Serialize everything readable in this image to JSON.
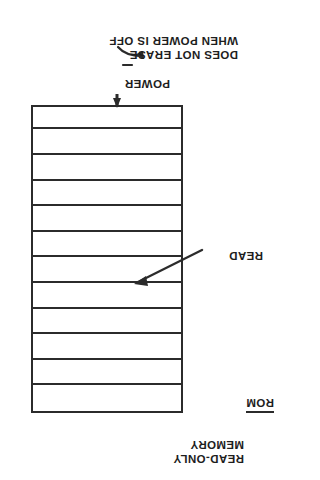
{
  "figure": {
    "kind": "technical-line-drawing",
    "orientation": "rotated-180-degrees",
    "ink_color": "#2b2b2b",
    "background_color": "#ffffff"
  },
  "memory_block": {
    "name": "rom-block",
    "row_count": 12,
    "rows": [
      {
        "index": 1
      },
      {
        "index": 2
      },
      {
        "index": 3
      },
      {
        "index": 4
      },
      {
        "index": 5
      },
      {
        "index": 6
      },
      {
        "index": 7
      },
      {
        "index": 8
      },
      {
        "index": 9
      },
      {
        "index": 10
      },
      {
        "index": 11
      },
      {
        "index": 12
      }
    ]
  },
  "labels": {
    "title_line_1": "READ-ONLY",
    "title_line_2": "MEMORY",
    "abbreviation": "ROM",
    "read": "READ",
    "power": "POWER",
    "note_line_1": "DOES NOT ERASE",
    "note_line_2": "WHEN POWER IS OFF"
  },
  "annotations": [
    {
      "name": "read-leader",
      "label": "READ",
      "style": "straight-leader-with-arrowhead",
      "points_to": "memory-row-interior"
    },
    {
      "name": "power-arrow",
      "label": "POWER",
      "style": "vertical-arrow",
      "points_to": "memory-block-edge"
    },
    {
      "name": "erase-note-leader",
      "label": "DOES NOT ERASE WHEN POWER IS OFF",
      "style": "curved-arrow-with-dash",
      "points_to": "power-label"
    }
  ]
}
